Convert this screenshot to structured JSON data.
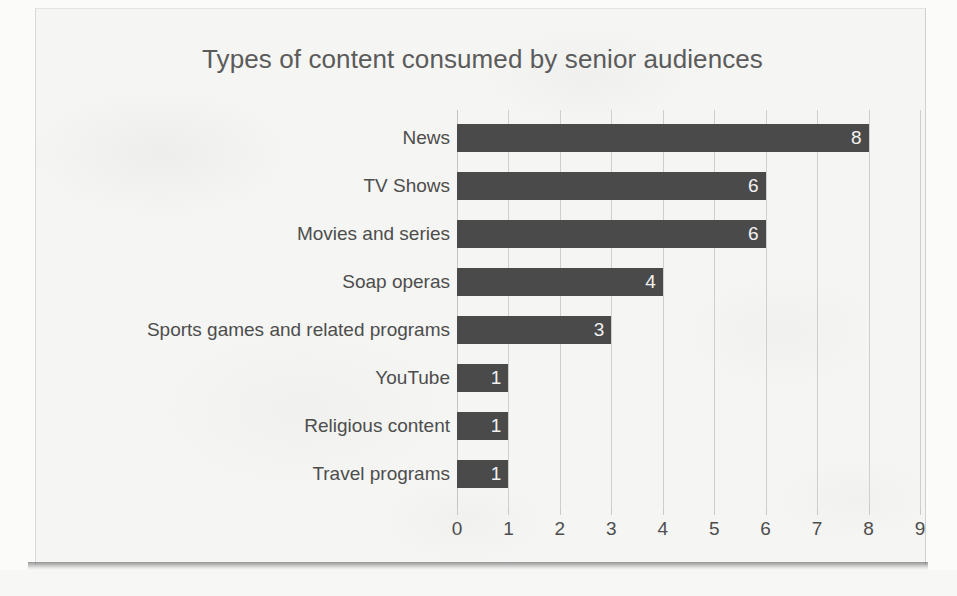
{
  "chart_data": {
    "type": "bar",
    "orientation": "horizontal",
    "title": "Types of content consumed by senior audiences",
    "xlabel": "",
    "ylabel": "",
    "categories": [
      "News",
      "TV Shows",
      "Movies and series",
      "Soap operas",
      "Sports games and related programs",
      "YouTube",
      "Religious content",
      "Travel programs"
    ],
    "values": [
      8,
      6,
      6,
      4,
      3,
      1,
      1,
      1
    ],
    "value_labels": [
      "8",
      "6",
      "6",
      "4",
      "3",
      "1",
      "1",
      "1"
    ],
    "xlim": [
      0,
      9
    ],
    "xticks": [
      0,
      1,
      2,
      3,
      4,
      5,
      6,
      7,
      8,
      9
    ],
    "xtick_labels": [
      "0",
      "1",
      "2",
      "3",
      "4",
      "5",
      "6",
      "7",
      "8",
      "9"
    ],
    "grid": true,
    "grid_axis": "x",
    "legend": false,
    "data_labels_inside_bars": true,
    "colors": {
      "bar": "#4a4a4a",
      "bar_value_text": "#f2f2f2",
      "category_label_text": "#4d4d4d",
      "tick_label_text": "#4d4d4d",
      "title_text": "#5b5b5b",
      "gridline": "#cfcfcd",
      "plot_background": "#f5f5f3"
    }
  }
}
